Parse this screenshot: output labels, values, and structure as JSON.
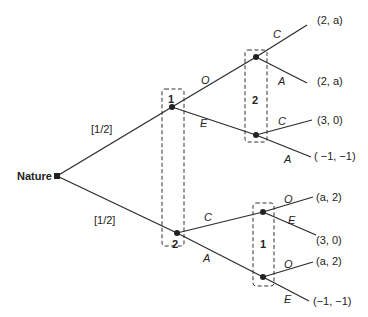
{
  "diagram": {
    "type": "extensive-form game tree",
    "root": {
      "label": "Nature"
    },
    "nature_probabilities": [
      "[1/2]",
      "[1/2]"
    ],
    "info_sets": [
      {
        "player": "1",
        "position": "upper"
      },
      {
        "player": "2",
        "position": "upper-right"
      },
      {
        "player": "2",
        "position": "lower"
      },
      {
        "player": "1",
        "position": "lower-right"
      }
    ],
    "actions": {
      "p1_upper": [
        "O",
        "E"
      ],
      "p2_after_O": [
        "C",
        "A"
      ],
      "p2_after_E": [
        "C",
        "A"
      ],
      "p2_lower": [
        "C",
        "A"
      ],
      "p1_after_C": [
        "O",
        "E"
      ],
      "p1_after_A": [
        "O",
        "E"
      ]
    },
    "payoffs": [
      "(2, a)",
      "(2, a)",
      "(3, 0)",
      "( −1, −1)",
      "(a, 2)",
      "(3, 0)",
      "(a, 2)",
      "(−1, −1)"
    ]
  }
}
